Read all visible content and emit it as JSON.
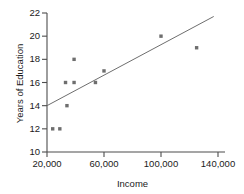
{
  "chart_data": {
    "type": "scatter",
    "title": "",
    "xlabel": "Income",
    "ylabel": "Years of Education",
    "xlim": [
      20000,
      140000
    ],
    "ylim": [
      10,
      22
    ],
    "grid": false,
    "legend": "none",
    "xticks": [
      20000,
      60000,
      100000,
      140000
    ],
    "xtick_labels": [
      "20,000",
      "60,000",
      "100,000",
      "140,000"
    ],
    "yticks": [
      10,
      12,
      14,
      16,
      18,
      20,
      22
    ],
    "ytick_labels": [
      "10",
      "12",
      "14",
      "16",
      "18",
      "20",
      "22"
    ],
    "marker_color": "#6e6e6e",
    "line_color": "#6e6e6e",
    "axis_color": "#4d4d4d",
    "points": [
      {
        "x": 24000,
        "y": 12
      },
      {
        "x": 29000,
        "y": 12
      },
      {
        "x": 34000,
        "y": 14
      },
      {
        "x": 33000,
        "y": 16
      },
      {
        "x": 39000,
        "y": 16
      },
      {
        "x": 39000,
        "y": 18
      },
      {
        "x": 54000,
        "y": 16
      },
      {
        "x": 60000,
        "y": 17
      },
      {
        "x": 100000,
        "y": 20
      },
      {
        "x": 125000,
        "y": 19
      }
    ],
    "trendline": {
      "x_start": 20000,
      "y_start": 14.0,
      "x_end": 137000,
      "y_end": 21.7
    }
  }
}
